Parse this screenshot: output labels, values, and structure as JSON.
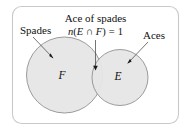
{
  "figure": {
    "kind": "venn-diagram",
    "universe_border_color": "#c9c9c9",
    "circle_fill_color": "#e6e6e6",
    "circle_stroke_color": "#8a8a8a",
    "text_color": "#111111"
  },
  "labels": {
    "left_callout": "Spades",
    "right_callout": "Aces",
    "center_callout_line1": "Ace of spades",
    "left_set_letter": "F",
    "right_set_letter": "E"
  },
  "formula": {
    "function_name": "n",
    "open_paren": "(",
    "set_a": "E",
    "operator": "∩",
    "set_b": "F",
    "close_paren": ")",
    "equals": "=",
    "value": "1",
    "full_text": "n(E ∩ F) = 1"
  },
  "watermark": {
    "text": ""
  }
}
